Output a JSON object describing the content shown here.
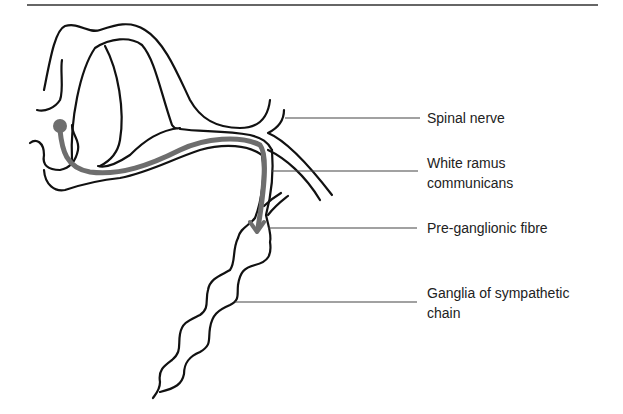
{
  "figure": {
    "type": "anatomical-diagram",
    "colors": {
      "line": "#111111",
      "pathway": "#6e6e6e",
      "leader": "#444444"
    }
  },
  "labels": [
    {
      "id": "spinal-nerve",
      "lines": [
        "Spinal nerve"
      ]
    },
    {
      "id": "white-ramus",
      "lines": [
        "White ramus",
        "communicans"
      ]
    },
    {
      "id": "pre-ganglionic",
      "lines": [
        "Pre-ganglionic fibre"
      ]
    },
    {
      "id": "ganglia",
      "lines": [
        "Ganglia of sympathetic",
        "chain"
      ]
    }
  ]
}
